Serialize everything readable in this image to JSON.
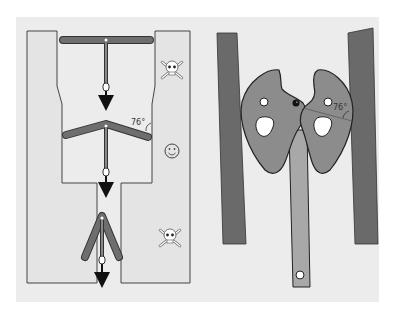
{
  "diagram": {
    "type": "mechanism-illustration",
    "background_color": "#ececec",
    "colors": {
      "wall_fill": "#e4e4e4",
      "wall_stroke": "#444444",
      "bar_fill": "#6e6e6e",
      "lobe_fill": "#8c8c8c",
      "pillar_fill": "#6a6a6a",
      "handle_fill": "#a8a8a8",
      "arrow": "#111111"
    },
    "left_panel": {
      "description": "Toggle bolt passing through narrowing channel",
      "stages": [
        {
          "id": "top",
          "state": "flat-bar",
          "icon": "skull-and-crossbones",
          "icon_glyph": "☠"
        },
        {
          "id": "middle",
          "state": "bent-bar",
          "angle_label": "76°",
          "icon": "smiley-face",
          "icon_glyph": "☺"
        },
        {
          "id": "bottom",
          "state": "folded-bar",
          "icon": "skull-and-crossbones",
          "icon_glyph": "☠"
        }
      ]
    },
    "right_panel": {
      "description": "Two cam lobes with handle wedged between walls",
      "angle_label": "76°"
    }
  }
}
